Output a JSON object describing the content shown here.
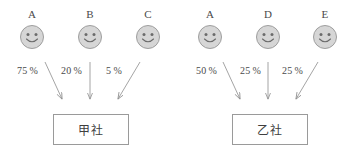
{
  "diagram": {
    "groups": [
      {
        "id": "group-left",
        "company": "甲社",
        "shareholders": [
          {
            "label": "A",
            "percent": "75 %",
            "icon": "smiley-face-icon"
          },
          {
            "label": "B",
            "percent": "20 %",
            "icon": "smiley-face-icon"
          },
          {
            "label": "C",
            "percent": "5 %",
            "icon": "smiley-face-icon"
          }
        ]
      },
      {
        "id": "group-right",
        "company": "乙社",
        "shareholders": [
          {
            "label": "A",
            "percent": "50 %",
            "icon": "smiley-face-icon"
          },
          {
            "label": "D",
            "percent": "25 %",
            "icon": "smiley-face-icon"
          },
          {
            "label": "E",
            "percent": "25 %",
            "icon": "smiley-face-icon"
          }
        ]
      }
    ],
    "colors": {
      "face_fill": "#d6d6d6",
      "face_stroke": "#9e9e9e",
      "line": "#9a9a9a",
      "text": "#4a4a4a",
      "background": "#ffffff"
    }
  }
}
